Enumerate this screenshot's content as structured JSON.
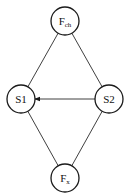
{
  "diagram": {
    "type": "graph",
    "nodes": [
      {
        "id": "Fch",
        "label": "F",
        "subscript": "ch",
        "cx": 65,
        "cy": 21,
        "r": 14
      },
      {
        "id": "S1",
        "label": "S1",
        "subscript": "",
        "cx": 21,
        "cy": 99,
        "r": 14
      },
      {
        "id": "S2",
        "label": "S2",
        "subscript": "",
        "cx": 109,
        "cy": 99,
        "r": 14
      },
      {
        "id": "Fx",
        "label": "F",
        "subscript": "x",
        "cx": 65,
        "cy": 178,
        "r": 14
      }
    ],
    "edges": [
      {
        "from": "Fch",
        "to": "S1",
        "directed": false
      },
      {
        "from": "Fch",
        "to": "S2",
        "directed": false
      },
      {
        "from": "S2",
        "to": "S1",
        "directed": true
      },
      {
        "from": "Fx",
        "to": "S1",
        "directed": false
      },
      {
        "from": "Fx",
        "to": "S2",
        "directed": false
      }
    ],
    "colors": {
      "stroke": "#1a1a1a",
      "background": "#ffffff"
    }
  }
}
